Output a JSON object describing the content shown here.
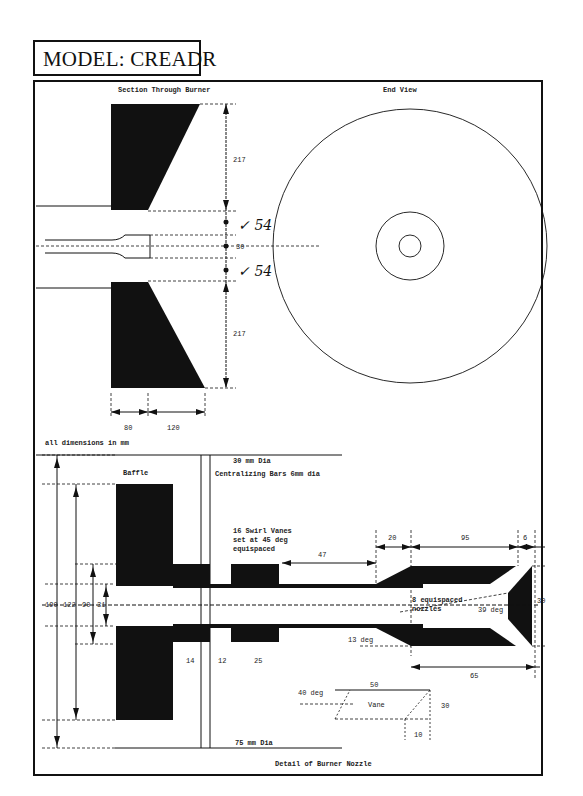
{
  "header": {
    "model_title": "MODEL: CREADR"
  },
  "section_view": {
    "title": "Section Through Burner",
    "dims": {
      "upper_height": "217",
      "lower_height": "217",
      "upper_gap": "54",
      "center_gap": "30",
      "lower_gap": "54",
      "width_a": "80",
      "width_b": "120"
    },
    "handwritten_upper": "✓ 54",
    "handwritten_lower": "✓ 54"
  },
  "end_view": {
    "title": "End View"
  },
  "note": "all dimensions in mm",
  "detail_view": {
    "title": "Detail of Burner Nozzle",
    "baffle_label": "Baffle",
    "top_note_1": "30 mm Dia",
    "top_note_2": "Centralizing Bars 6mm dia",
    "swirl_note": [
      "16 Swirl Vanes",
      "set at 45 deg",
      "equispaced"
    ],
    "bottom_note": "75 mm Dia",
    "port_note": [
      "8 equispaced",
      "nozzles"
    ],
    "vertical_dims": [
      "190",
      "122",
      "90",
      "31"
    ],
    "horizontal_dims": {
      "d14": "14",
      "d12": "12",
      "d25": "25",
      "d47": "47",
      "d20": "20",
      "d95": "95",
      "d6": "6",
      "d65": "65",
      "d30_right": "30"
    },
    "angles": {
      "cone": "13 deg",
      "nozzle": "39 deg",
      "vane": "40 deg"
    },
    "vane_detail": {
      "label": "Vane",
      "length": "50",
      "height": "30",
      "offset": "10"
    }
  }
}
